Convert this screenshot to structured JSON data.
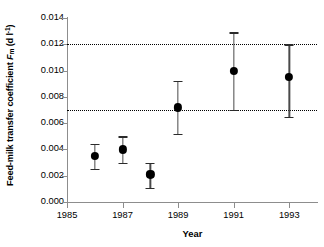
{
  "chart_data": {
    "type": "scatter",
    "title": "",
    "xlabel": "Year",
    "ylabel_plain": "Feed-milk transfer coefficient Fm (d l-1)",
    "ylabel_prefix": "Feed-milk transfer coefficient ",
    "ylabel_symbol": "F",
    "ylabel_subscript": "m",
    "ylabel_units_open": " (d l",
    "ylabel_units_exp": "-1",
    "ylabel_units_close": ")",
    "x": [
      1986,
      1987,
      1988,
      1989,
      1991,
      1993
    ],
    "values": [
      0.0035,
      0.004,
      0.0021,
      0.0072,
      0.01,
      0.0095
    ],
    "error_low": [
      0.0025,
      0.003,
      0.0011,
      0.0052,
      0.007,
      0.0065
    ],
    "error_high": [
      0.0044,
      0.005,
      0.003,
      0.0092,
      0.0129,
      0.012
    ],
    "xlim": [
      1985,
      1994
    ],
    "ylim": [
      0.0,
      0.014
    ],
    "xticks": [
      1985,
      1987,
      1989,
      1991,
      1993
    ],
    "xtick_labels": [
      "1985",
      "1987",
      "1989",
      "1991",
      "1993"
    ],
    "yticks": [
      0.0,
      0.002,
      0.004,
      0.006,
      0.008,
      0.01,
      0.012,
      0.014
    ],
    "ytick_labels": [
      "0.000",
      "0.002",
      "0.004",
      "0.006",
      "0.008",
      "0.010",
      "0.012",
      "0.014"
    ],
    "reference_lines": [
      0.007,
      0.012
    ],
    "grid": false,
    "legend": false,
    "marker_color": "#000000",
    "errorbar_color": "#4a4a4a",
    "axis_color": "#8d8d8d",
    "background_color": "#ffffff"
  }
}
